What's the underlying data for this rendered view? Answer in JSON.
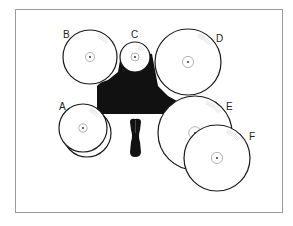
{
  "diagram": {
    "type": "drum-kit-top-view",
    "frame": {
      "x": 15,
      "y": 9,
      "width": 267,
      "height": 203,
      "stroke": "#9a9a9a"
    },
    "colors": {
      "stroke": "#1a1a1a",
      "fill": "#ffffff",
      "kit_body": "#111111",
      "hub": "#aaaaaa"
    },
    "cymbals": [
      {
        "label": "A",
        "cx": 83,
        "cy": 128,
        "r": 24,
        "label_x": 59,
        "label_y": 110,
        "double": true
      },
      {
        "label": "B",
        "cx": 90,
        "cy": 57,
        "r": 27,
        "label_x": 63,
        "label_y": 38,
        "double": false
      },
      {
        "label": "C",
        "cx": 135,
        "cy": 57,
        "r": 15,
        "label_x": 131,
        "label_y": 38,
        "double": false
      },
      {
        "label": "D",
        "cx": 188,
        "cy": 62,
        "r": 33,
        "label_x": 216,
        "label_y": 42,
        "double": false
      },
      {
        "label": "E",
        "cx": 195,
        "cy": 133,
        "r": 37,
        "label_x": 226,
        "label_y": 110,
        "double": false
      },
      {
        "label": "F",
        "cx": 217,
        "cy": 158,
        "r": 33,
        "label_x": 249,
        "label_y": 140,
        "double": false
      }
    ]
  }
}
